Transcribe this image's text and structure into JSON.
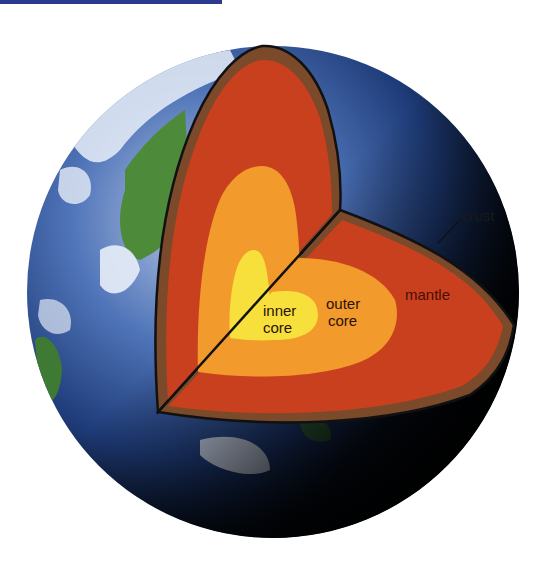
{
  "diagram": {
    "labels": {
      "crust": "crust",
      "mantle": "mantle",
      "outer_core_line1": "outer",
      "outer_core_line2": "core",
      "inner_core_line1": "inner",
      "inner_core_line2": "core"
    },
    "layers": [
      {
        "name": "crust",
        "color": "#7a4a2a"
      },
      {
        "name": "mantle",
        "color": "#c8401e"
      },
      {
        "name": "outer core",
        "color": "#f39a2c"
      },
      {
        "name": "inner core",
        "color": "#f7e03c"
      }
    ],
    "colors": {
      "ocean": "#3a62a8",
      "land": "#4d8a3a",
      "night": "#050810",
      "top_bar": "#2b3a8c"
    }
  }
}
